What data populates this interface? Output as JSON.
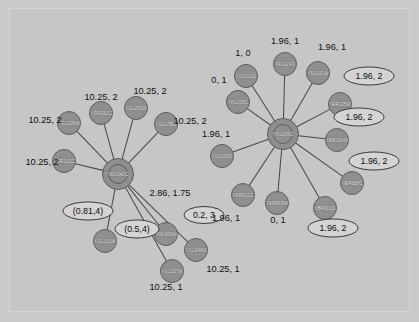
{
  "figure": {
    "type": "network-diagram",
    "background_color": "#c6c6c6",
    "node_color": "#8f8f8f",
    "hub_ring_color": "#171717",
    "edge_color": "#4a4a4a"
  },
  "clusters": [
    {
      "id": "left-cluster",
      "hub": {
        "label": "YDL042C",
        "x": 118,
        "y": 174
      },
      "neighbors": [
        {
          "label": "YGL206W",
          "x": 69,
          "y": 123
        },
        {
          "label": "YGR231C",
          "x": 101,
          "y": 113
        },
        {
          "label": "YGL253W",
          "x": 136,
          "y": 108
        },
        {
          "label": "YGL178W",
          "x": 166,
          "y": 124
        },
        {
          "label": "YGR132C",
          "x": 64,
          "y": 161
        },
        {
          "label": "YGL133W",
          "x": 105,
          "y": 241
        },
        {
          "label": "YML069W",
          "x": 166,
          "y": 234
        },
        {
          "label": "YGL207W",
          "x": 172,
          "y": 271
        },
        {
          "label": "YGL244W",
          "x": 196,
          "y": 250
        }
      ]
    },
    {
      "id": "right-cluster",
      "hub": {
        "label": "YOL006C",
        "x": 283,
        "y": 134
      },
      "neighbors": [
        {
          "label": "YGL013C",
          "x": 246,
          "y": 76
        },
        {
          "label": "YFL024C",
          "x": 285,
          "y": 64
        },
        {
          "label": "YFL031W",
          "x": 318,
          "y": 73
        },
        {
          "label": "YFL039C",
          "x": 238,
          "y": 102
        },
        {
          "label": "YER125W",
          "x": 340,
          "y": 104
        },
        {
          "label": "YER164W",
          "x": 337,
          "y": 140
        },
        {
          "label": "YGL035C",
          "x": 222,
          "y": 156
        },
        {
          "label": "YFR031C",
          "x": 243,
          "y": 195
        },
        {
          "label": "YER069W",
          "x": 277,
          "y": 203
        },
        {
          "label": "YBR003C",
          "x": 325,
          "y": 208
        },
        {
          "label": "YER088C",
          "x": 352,
          "y": 183
        }
      ]
    }
  ],
  "stat_labels": [
    {
      "text": "10.25, 2",
      "x": 45,
      "y": 123
    },
    {
      "text": "10.25, 2",
      "x": 101,
      "y": 100
    },
    {
      "text": "10.25, 2",
      "x": 150,
      "y": 94
    },
    {
      "text": "10.25, 2",
      "x": 190,
      "y": 124
    },
    {
      "text": "10.25, 2",
      "x": 42,
      "y": 165
    },
    {
      "text": "2.86, 1.75",
      "x": 170,
      "y": 196
    },
    {
      "text": "1.96, 1",
      "x": 226,
      "y": 221
    },
    {
      "text": "0, 1",
      "x": 278,
      "y": 223
    },
    {
      "text": "10.25, 1",
      "x": 166,
      "y": 290
    },
    {
      "text": "10.25, 1",
      "x": 223,
      "y": 272
    },
    {
      "text": "1, 0",
      "x": 243,
      "y": 56
    },
    {
      "text": "1.96, 1",
      "x": 285,
      "y": 44
    },
    {
      "text": "1.96, 1",
      "x": 332,
      "y": 50
    },
    {
      "text": "0, 1",
      "x": 219,
      "y": 83
    },
    {
      "text": "1.96, 1",
      "x": 216,
      "y": 137
    }
  ],
  "ellipse_labels": [
    {
      "text": "(0.81,4)",
      "x": 88,
      "y": 211,
      "rx": 25,
      "ry": 9
    },
    {
      "text": "(0.5,4)",
      "x": 137,
      "y": 229,
      "rx": 22,
      "ry": 9
    },
    {
      "text": "0.2, 3",
      "x": 204,
      "y": 215,
      "rx": 20,
      "ry": 8.5
    },
    {
      "text": "1.96, 2",
      "x": 369,
      "y": 76,
      "rx": 25,
      "ry": 9
    },
    {
      "text": "1.96, 2",
      "x": 359,
      "y": 117,
      "rx": 25,
      "ry": 9
    },
    {
      "text": "1.96, 2",
      "x": 374,
      "y": 161,
      "rx": 25,
      "ry": 9
    },
    {
      "text": "1.96, 2",
      "x": 333,
      "y": 228,
      "rx": 25,
      "ry": 9
    }
  ]
}
